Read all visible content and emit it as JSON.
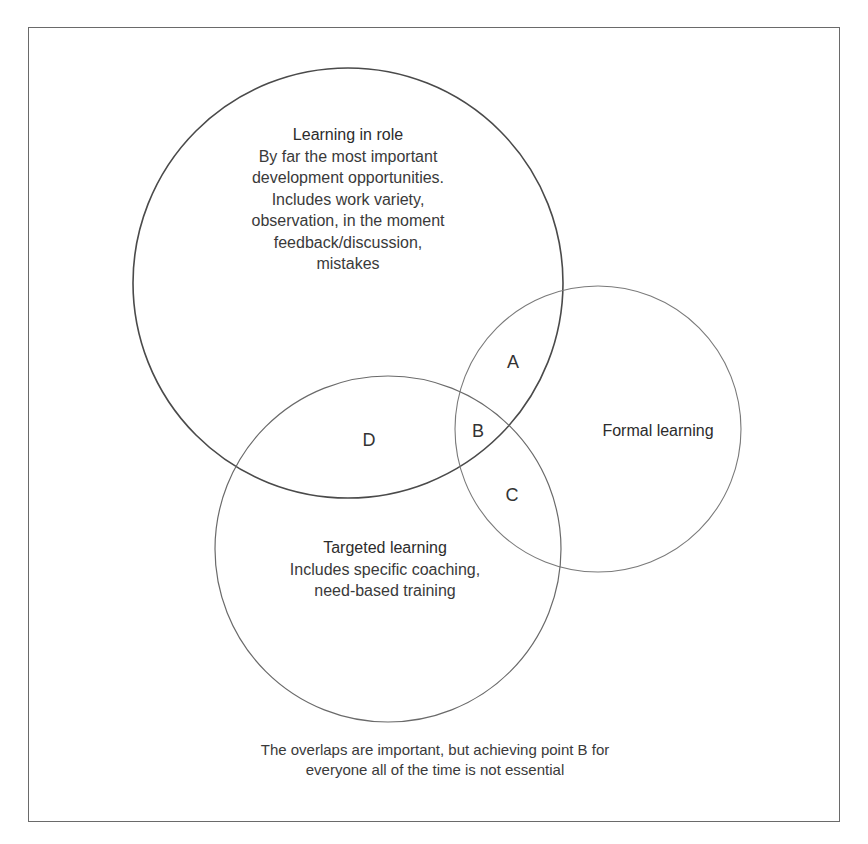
{
  "diagram": {
    "type": "venn",
    "circles": [
      {
        "id": "learning-in-role",
        "title": "Learning in role",
        "description_lines": [
          "By far the most important",
          "development opportunities.",
          "Includes work variety,",
          "observation, in the moment",
          "feedback/discussion,",
          "mistakes"
        ]
      },
      {
        "id": "formal-learning",
        "title": "Formal learning",
        "description_lines": []
      },
      {
        "id": "targeted-learning",
        "title": "Targeted learning",
        "description_lines": [
          "Includes specific coaching,",
          "need-based training"
        ]
      }
    ],
    "regions": {
      "A": "A",
      "B": "B",
      "C": "C",
      "D": "D"
    },
    "caption_lines": [
      "The overlaps are important, but achieving point B for",
      "everyone all of the time is not essential"
    ],
    "colors": {
      "stroke_primary": "#4a4a4a",
      "stroke_secondary": "#7a7a7a",
      "text": "#3a3a3a",
      "background": "#ffffff"
    }
  }
}
